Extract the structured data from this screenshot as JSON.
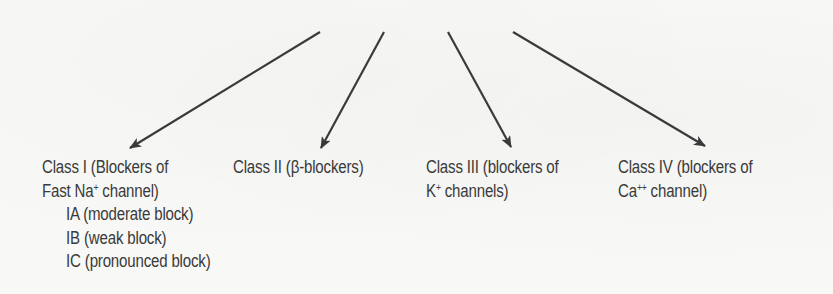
{
  "diagram": {
    "type": "classification-tree",
    "arrow_color": "#3a3a3a",
    "arrows": [
      {
        "from": [
          320,
          32
        ],
        "to": [
          130,
          148
        ],
        "target": "class-1"
      },
      {
        "from": [
          384,
          32
        ],
        "to": [
          321,
          148
        ],
        "target": "class-2"
      },
      {
        "from": [
          448,
          32
        ],
        "to": [
          511,
          147
        ],
        "target": "class-3"
      },
      {
        "from": [
          513,
          32
        ],
        "to": [
          705,
          146
        ],
        "target": "class-4"
      }
    ],
    "classes": [
      {
        "id": "class-1",
        "line1": "Class I (Blockers of",
        "line2_pre": "Fast Na",
        "line2_sup": "+",
        "line2_post": " channel)",
        "subclasses": [
          "IA (moderate block)",
          "IB (weak block)",
          "IC (pronounced block)"
        ]
      },
      {
        "id": "class-2",
        "line1": "Class II (β-blockers)"
      },
      {
        "id": "class-3",
        "line1": "Class III (blockers of",
        "line2_pre": "K",
        "line2_sup": "+",
        "line2_post": " channels)"
      },
      {
        "id": "class-4",
        "line1": "Class IV (blockers of",
        "line2_pre": "Ca",
        "line2_sup": "++",
        "line2_post": " channel)"
      }
    ]
  }
}
